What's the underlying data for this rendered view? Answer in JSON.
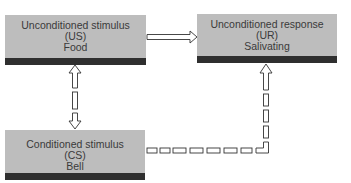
{
  "diagram": {
    "nodes": [
      {
        "id": "us",
        "label": "Unconditioned stimulus",
        "abbr": "(US)",
        "example": "Food"
      },
      {
        "id": "ur",
        "label": "Unconditioned response",
        "abbr": "(UR)",
        "example": "Salivating"
      },
      {
        "id": "cs",
        "label": "Conditioned stimulus",
        "abbr": "(CS)",
        "example": "Bell"
      }
    ],
    "edges": [
      {
        "from": "us",
        "to": "ur",
        "style": "solid-hollow-arrow"
      },
      {
        "from": "us",
        "to": "cs",
        "style": "double-headed-hollow-arrow"
      },
      {
        "from": "cs",
        "to": "ur",
        "style": "dashed-hollow-arrow"
      }
    ],
    "colors": {
      "box_fill": "#bdbdbd",
      "box_bar": "#2f2f2f",
      "text": "#3a3a3a",
      "arrow_stroke": "#333333"
    }
  }
}
